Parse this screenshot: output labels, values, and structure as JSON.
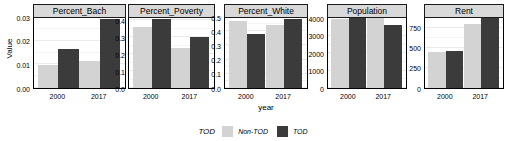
{
  "chart_data": {
    "type": "bar",
    "title": "",
    "xlabel": "year",
    "ylabel": "Value",
    "grid": true,
    "legend_position": "bottom",
    "legend_title": "TOD",
    "categories": [
      "2000",
      "2017"
    ],
    "series": [
      {
        "name": "Non-TOD",
        "color": "#d3d3d3"
      },
      {
        "name": "TOD",
        "color": "#3b3b3b"
      }
    ],
    "facets": [
      {
        "name": "Percent_Bach",
        "ylim": [
          0,
          0.03
        ],
        "yticks": [
          "0.00",
          "0.01",
          "0.02",
          "0.03"
        ],
        "ytick_values": [
          0,
          0.01,
          0.02,
          0.03
        ],
        "values": {
          "Non-TOD": [
            0.0098,
            0.0116
          ],
          "TOD": [
            0.0163,
            0.029
          ]
        }
      },
      {
        "name": "Percent_Poverty",
        "ylim": [
          0,
          0.42
        ],
        "yticks": [
          "0.0",
          "0.1",
          "0.2",
          "0.3",
          "0.4"
        ],
        "ytick_values": [
          0,
          0.1,
          0.2,
          0.3,
          0.4
        ],
        "values": {
          "Non-TOD": [
            0.362,
            0.235
          ],
          "TOD": [
            0.408,
            0.3
          ]
        }
      },
      {
        "name": "Percent_White",
        "ylim": [
          0,
          0.5
        ],
        "yticks": [
          "0.0",
          "0.1",
          "0.2",
          "0.3",
          "0.4",
          "0.5"
        ],
        "ytick_values": [
          0,
          0.1,
          0.2,
          0.3,
          0.4,
          0.5
        ],
        "values": {
          "Non-TOD": [
            0.472,
            0.443
          ],
          "TOD": [
            0.381,
            0.487
          ]
        }
      },
      {
        "name": "Population",
        "ylim": [
          0,
          4080
        ],
        "yticks": [
          "0",
          "1000",
          "2000",
          "3000",
          "4000"
        ],
        "ytick_values": [
          0,
          1000,
          2000,
          3000,
          4000
        ],
        "values": {
          "Non-TOD": [
            3980,
            4080
          ],
          "TOD": [
            4080,
            3620
          ]
        }
      },
      {
        "name": "Rent",
        "ylim": [
          0,
          880
        ],
        "yticks": [
          "0",
          "250",
          "500",
          "750"
        ],
        "ytick_values": [
          0,
          250,
          500,
          750
        ],
        "values": {
          "Non-TOD": [
            450,
            793
          ],
          "TOD": [
            462,
            872
          ]
        }
      }
    ]
  }
}
